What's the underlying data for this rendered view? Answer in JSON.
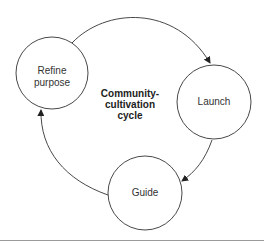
{
  "diagram": {
    "title_lines": [
      "Community-",
      "cultivation",
      "cycle"
    ],
    "nodes": [
      {
        "id": "refine",
        "lines": [
          "Refine",
          "purpose"
        ],
        "cx": 52,
        "cy": 73,
        "r": 36
      },
      {
        "id": "launch",
        "lines": [
          "Launch"
        ],
        "cx": 214,
        "cy": 102,
        "r": 37
      },
      {
        "id": "guide",
        "lines": [
          "Guide"
        ],
        "cx": 145,
        "cy": 193,
        "r": 37
      }
    ],
    "edges": [
      {
        "from": "refine",
        "to": "launch"
      },
      {
        "from": "launch",
        "to": "guide"
      },
      {
        "from": "guide",
        "to": "refine"
      }
    ],
    "colors": {
      "stroke": "#333333",
      "text": "#333333",
      "rule": "#9a9a9a"
    }
  }
}
